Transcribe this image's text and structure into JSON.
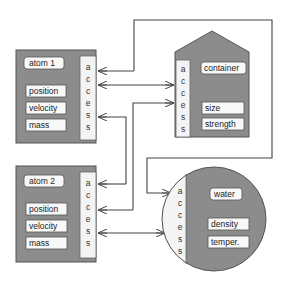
{
  "colors": {
    "object_fill": "#8c8c8c",
    "object_stroke": "#555555",
    "access_fill": "#f4f4f4",
    "label_fill": "#f8f8f8",
    "line": "#444444",
    "background": "#ffffff"
  },
  "objects": [
    {
      "id": "atom1",
      "shape": "rectangle",
      "title": "atom 1",
      "access_letters": [
        "a",
        "c",
        "c",
        "e",
        "s",
        "s"
      ],
      "fields": [
        "position",
        "velocity",
        "mass"
      ]
    },
    {
      "id": "atom2",
      "shape": "rectangle",
      "title": "atom 2",
      "access_letters": [
        "a",
        "c",
        "c",
        "e",
        "s",
        "s"
      ],
      "fields": [
        "position",
        "velocity",
        "mass"
      ]
    },
    {
      "id": "container",
      "shape": "house",
      "title": "container",
      "access_letters": [
        "a",
        "c",
        "c",
        "e",
        "s",
        "s"
      ],
      "fields": [
        "size",
        "strength"
      ]
    },
    {
      "id": "water",
      "shape": "circle",
      "title": "water",
      "access_letters": [
        "a",
        "c",
        "c",
        "e",
        "s",
        "s"
      ],
      "fields": [
        "density",
        "temper."
      ]
    }
  ],
  "connections": [
    {
      "from": "container",
      "to": "atom1",
      "type": "arrow"
    },
    {
      "from": "atom1",
      "to": "container",
      "type": "double-arrow"
    },
    {
      "from": "atom2",
      "to": "container",
      "type": "arrow"
    },
    {
      "from": "water",
      "to": "atom1",
      "type": "arrow"
    },
    {
      "from": "container",
      "to": "atom2",
      "type": "arrow"
    },
    {
      "from": "container",
      "to": "water",
      "type": "arrow"
    },
    {
      "from": "atom2",
      "to": "water",
      "type": "double-arrow"
    }
  ]
}
